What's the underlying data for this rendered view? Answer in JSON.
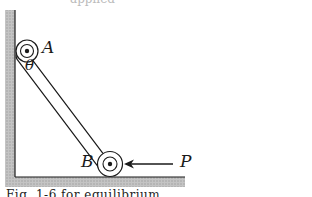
{
  "figure": {
    "labels": {
      "pin_top": "A",
      "angle": "θ",
      "pin_bottom": "B",
      "force": "P"
    },
    "caption": "Fig. 1-6 for equilibrium",
    "top_cut_text": "applied"
  },
  "colors": {
    "ink": "#1a1a1a",
    "ground_hatch": "#b9b9b9",
    "background": "#ffffff"
  }
}
